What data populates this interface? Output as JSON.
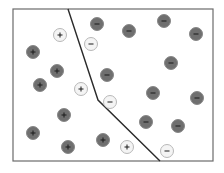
{
  "diagram": {
    "frame": {
      "x": 13,
      "y": 9,
      "width": 200,
      "height": 152,
      "stroke": "#6b6b6b"
    },
    "boundary": {
      "points": [
        [
          68,
          9
        ],
        [
          98,
          100
        ],
        [
          160,
          161
        ]
      ],
      "stroke": "#2b2b2b"
    },
    "colors": {
      "dark_fill": "#6f6f6f",
      "dark_stroke": "#888888",
      "light_fill": "#f4f4f4",
      "light_stroke": "#b8b8b8",
      "glyph": "#1a1a1a"
    },
    "points": [
      {
        "x": 33,
        "y": 52,
        "sign": "+",
        "style": "dark"
      },
      {
        "x": 57,
        "y": 71,
        "sign": "+",
        "style": "dark"
      },
      {
        "x": 40,
        "y": 85,
        "sign": "+",
        "style": "dark"
      },
      {
        "x": 64,
        "y": 115,
        "sign": "+",
        "style": "dark"
      },
      {
        "x": 33,
        "y": 133,
        "sign": "+",
        "style": "dark"
      },
      {
        "x": 68,
        "y": 147,
        "sign": "+",
        "style": "dark"
      },
      {
        "x": 103,
        "y": 140,
        "sign": "+",
        "style": "dark"
      },
      {
        "x": 60,
        "y": 35,
        "sign": "+",
        "style": "light"
      },
      {
        "x": 81,
        "y": 89,
        "sign": "+",
        "style": "light"
      },
      {
        "x": 127,
        "y": 147,
        "sign": "+",
        "style": "light"
      },
      {
        "x": 97,
        "y": 24,
        "sign": "-",
        "style": "dark"
      },
      {
        "x": 129,
        "y": 31,
        "sign": "-",
        "style": "dark"
      },
      {
        "x": 164,
        "y": 21,
        "sign": "-",
        "style": "dark"
      },
      {
        "x": 196,
        "y": 34,
        "sign": "-",
        "style": "dark"
      },
      {
        "x": 171,
        "y": 63,
        "sign": "-",
        "style": "dark"
      },
      {
        "x": 107,
        "y": 75,
        "sign": "-",
        "style": "dark"
      },
      {
        "x": 153,
        "y": 93,
        "sign": "-",
        "style": "dark"
      },
      {
        "x": 197,
        "y": 98,
        "sign": "-",
        "style": "dark"
      },
      {
        "x": 146,
        "y": 122,
        "sign": "-",
        "style": "dark"
      },
      {
        "x": 178,
        "y": 126,
        "sign": "-",
        "style": "dark"
      },
      {
        "x": 91,
        "y": 44,
        "sign": "-",
        "style": "light"
      },
      {
        "x": 110,
        "y": 102,
        "sign": "-",
        "style": "light"
      },
      {
        "x": 167,
        "y": 151,
        "sign": "-",
        "style": "light"
      }
    ]
  }
}
